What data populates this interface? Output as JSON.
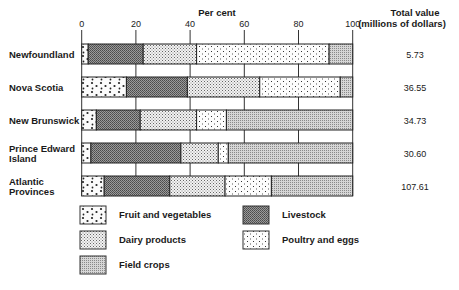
{
  "chart_data": {
    "type": "bar",
    "orientation": "horizontal",
    "stacked": true,
    "title": "",
    "xlabel": "Per cent",
    "ylabel": "",
    "xlim": [
      0,
      100
    ],
    "xticks": [
      0,
      20,
      40,
      60,
      80,
      100
    ],
    "xtick_labels": [
      "0",
      "20",
      "40",
      "60",
      "80",
      "100"
    ],
    "grid": true,
    "legend_position": "bottom",
    "categories": [
      "Newfoundland",
      "Nova Scotia",
      "New Brunswick",
      "Prince Edward Island",
      "Atlantic Provinces"
    ],
    "category_label_lines": [
      [
        "Newfoundland"
      ],
      [
        "Nova Scotia"
      ],
      [
        "New Brunswick"
      ],
      [
        "Prince Edward",
        "Island"
      ],
      [
        "Atlantic",
        "Provinces"
      ]
    ],
    "series": [
      {
        "name": "Fruit and vegetables",
        "pattern": "fruit",
        "values": [
          2.4,
          16.5,
          5.4,
          3.4,
          8.3
        ]
      },
      {
        "name": "Livestock",
        "pattern": "livestock",
        "values": [
          20.3,
          22.5,
          16.2,
          33.2,
          24.2
        ]
      },
      {
        "name": "Dairy products",
        "pattern": "dairy",
        "values": [
          19.7,
          26.7,
          20.8,
          13.8,
          20.4
        ]
      },
      {
        "name": "Poultry and eggs",
        "pattern": "poultry",
        "values": [
          48.9,
          29.7,
          11.0,
          3.7,
          17.1
        ]
      },
      {
        "name": "Field crops",
        "pattern": "field",
        "values": [
          8.7,
          4.6,
          46.6,
          45.9,
          30.0
        ]
      }
    ],
    "total_value": {
      "header_lines": [
        "Total value",
        "(millions of dollars)"
      ],
      "values": [
        "5.73",
        "36.55",
        "34.73",
        "30.60",
        "107.61"
      ]
    },
    "legend_order": [
      [
        "Fruit and vegetables",
        "Livestock"
      ],
      [
        "Dairy products",
        "Poultry and eggs"
      ],
      [
        "Field crops"
      ]
    ]
  }
}
